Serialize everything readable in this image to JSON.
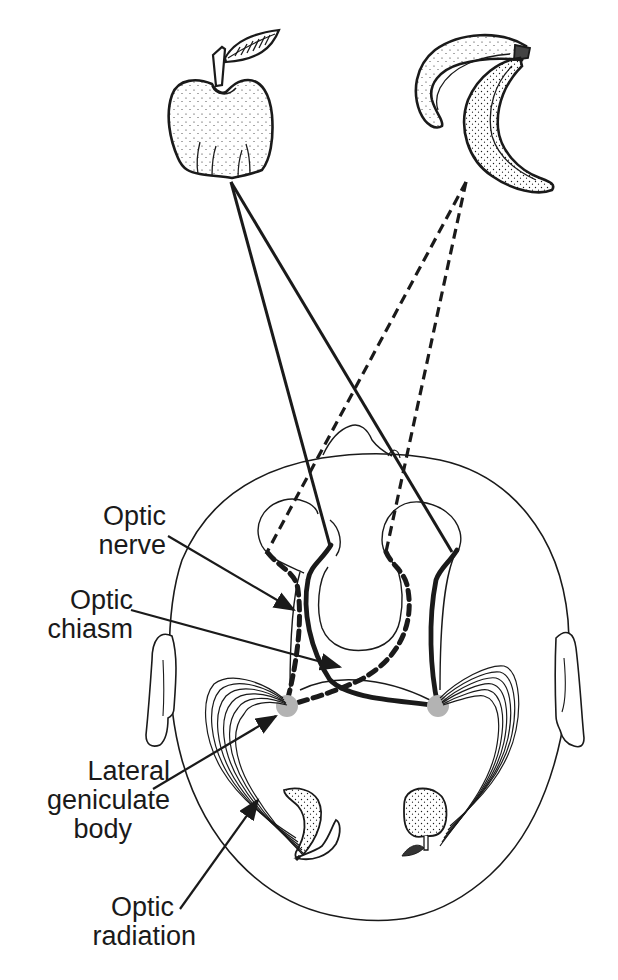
{
  "figure": {
    "colors": {
      "ink": "#1a1a1a",
      "lgn_fill": "#b3b3b3",
      "background": "#ffffff"
    },
    "objects": {
      "left_object": "apple",
      "right_object": "bananas"
    },
    "pathways": {
      "solid": "apple pathway (solid line)",
      "dashed": "banana pathway (dashed line)"
    }
  },
  "labels": {
    "optic_nerve": {
      "line1": "Optic",
      "line2": "nerve"
    },
    "optic_chiasm": {
      "line1": "Optic",
      "line2": "chiasm"
    },
    "lateral_geniculate_body": {
      "line1": "Lateral",
      "line2": "geniculate",
      "line3": "body"
    },
    "optic_radiation": {
      "line1": "Optic",
      "line2": "radiation"
    }
  }
}
